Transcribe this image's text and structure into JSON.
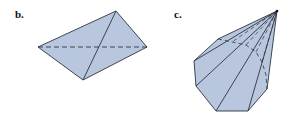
{
  "figures": [
    {
      "label": "b.",
      "description": "Tetrahedron drawn as quadrilateral outline with one visible diagonal and one hidden (dashed) diagonal",
      "vertices": {
        "left": [
          38,
          47
        ],
        "top": [
          116,
          11
        ],
        "right": [
          147,
          47
        ],
        "bottom": [
          83,
          80
        ]
      },
      "visible_edges": [
        [
          "left",
          "top"
        ],
        [
          "top",
          "right"
        ],
        [
          "right",
          "bottom"
        ],
        [
          "bottom",
          "left"
        ],
        [
          "top",
          "bottom"
        ]
      ],
      "hidden_edges": [
        [
          "left",
          "right"
        ]
      ]
    },
    {
      "label": "c.",
      "description": "Pyramid with polygonal (nonagon-like) base and apex at top right; hidden base edges dashed",
      "apex": [
        277,
        11
      ],
      "base_vertices": [
        [
          218,
          39
        ],
        [
          194,
          61
        ],
        [
          196,
          86
        ],
        [
          216,
          111
        ],
        [
          248,
          111
        ],
        [
          267,
          89
        ]
      ],
      "hidden_base_points": [
        [
          218,
          39
        ],
        [
          232,
          42
        ],
        [
          246,
          45
        ],
        [
          256,
          52
        ],
        [
          262,
          62
        ],
        [
          266,
          75
        ],
        [
          267,
          89
        ]
      ]
    }
  ],
  "colors": {
    "fill": "#b8c6de",
    "stroke": "#2e3440",
    "background": "#ffffff"
  }
}
